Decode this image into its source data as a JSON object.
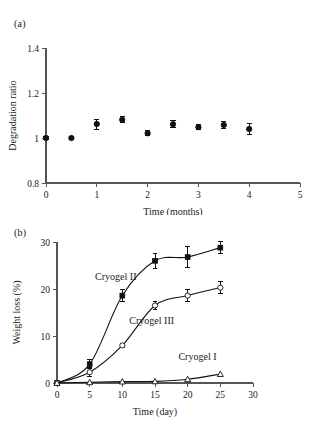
{
  "figure": {
    "panel_a_label": "(a)",
    "panel_b_label": "(b)"
  },
  "chart_data": [
    {
      "panel": "(a)",
      "type": "scatter",
      "title": "",
      "xlabel": "Time (months)",
      "ylabel": "Degradation ratio",
      "xlim": [
        0,
        5
      ],
      "ylim": [
        0.8,
        1.4
      ],
      "xticks": [
        0,
        1,
        2,
        3,
        4,
        5
      ],
      "xticklabels": [
        "0",
        "1",
        "2",
        "3",
        "4",
        "5"
      ],
      "yticks": [
        0.8,
        1.0,
        1.2,
        1.4
      ],
      "yticklabels": [
        "0.8",
        "1",
        "1.2",
        "1.4"
      ],
      "grid": false,
      "legend": "none",
      "marker": "filled-circle",
      "x": [
        0,
        0.5,
        1,
        1.5,
        2,
        2.5,
        3,
        3.5,
        4
      ],
      "values": [
        1.0,
        1.0,
        1.062,
        1.081,
        1.021,
        1.061,
        1.048,
        1.058,
        1.04
      ],
      "errors": [
        0.008,
        0.008,
        0.022,
        0.014,
        0.011,
        0.016,
        0.012,
        0.015,
        0.026
      ]
    },
    {
      "panel": "(b)",
      "type": "line",
      "title": "",
      "xlabel": "Time (day)",
      "ylabel": "Weight loss (%)",
      "xlim": [
        0,
        30
      ],
      "ylim": [
        0,
        30
      ],
      "xticks": [
        0,
        5,
        10,
        15,
        20,
        25,
        30
      ],
      "xticklabels": [
        "0",
        "5",
        "10",
        "15",
        "20",
        "25",
        "30"
      ],
      "yticks": [
        0,
        10,
        20,
        30
      ],
      "yticklabels": [
        "0",
        "10",
        "20",
        "30"
      ],
      "grid": false,
      "legend": "inline-annotations",
      "x": [
        0,
        5,
        10,
        15,
        20,
        25
      ],
      "series": [
        {
          "name": "Cryogel II",
          "marker": "filled-square",
          "label_x": 9.0,
          "label_y": 22.0,
          "values": [
            0,
            4.0,
            18.6,
            26.0,
            26.8,
            28.8
          ],
          "errors": [
            0,
            0.9,
            1.3,
            1.6,
            2.2,
            1.3
          ]
        },
        {
          "name": "Cryogel III",
          "marker": "open-circle",
          "label_x": 14.5,
          "label_y": 12.6,
          "values": [
            0,
            2.3,
            8.0,
            16.5,
            18.6,
            20.3
          ],
          "errors": [
            0,
            0.9,
            0.5,
            0.8,
            1.2,
            1.2
          ]
        },
        {
          "name": "Cryogel I",
          "marker": "open-triangle",
          "label_x": 21.5,
          "label_y": 5.0,
          "values": [
            0,
            0.15,
            0.3,
            0.35,
            0.8,
            1.9
          ],
          "errors": [
            0,
            0,
            0,
            0,
            0,
            0
          ]
        }
      ]
    }
  ]
}
